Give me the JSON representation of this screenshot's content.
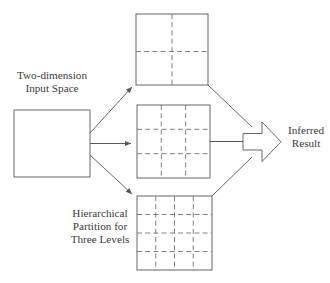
{
  "diagram": {
    "colors": {
      "solid_stroke": "#55565a",
      "dashed_stroke": "#6f7073",
      "text": "#3a3a3a",
      "background": "#ffffff"
    },
    "labels": {
      "input_space": "Two-dimension\nInput Space",
      "input_space_line1": "Two-dimension",
      "input_space_line2": "Input Space",
      "hierarchical_line1": "Hierarchical",
      "hierarchical_line2": "Partition for",
      "hierarchical_line3": "Three Levels",
      "inferred_line1": "Inferred",
      "inferred_line2": "Result"
    },
    "nodes": {
      "input_square": {
        "name": "two-dimension-input-space",
        "x": 14,
        "y": 110,
        "w": 76,
        "h": 67,
        "divisions": 1,
        "partition_label": "undivided"
      },
      "level_one_square": {
        "name": "partition-level-1",
        "x": 136,
        "y": 14,
        "w": 72,
        "h": 71,
        "divisions": 2,
        "partition_label": "2 x 2"
      },
      "level_two_square": {
        "name": "partition-level-2",
        "x": 137,
        "y": 105,
        "w": 73,
        "h": 73,
        "divisions": 3,
        "partition_label": "3 x 3"
      },
      "level_three_square": {
        "name": "partition-level-3",
        "x": 137,
        "y": 196,
        "w": 75,
        "h": 74,
        "divisions": 4,
        "partition_label": "4 x 4"
      },
      "result_arrow": {
        "name": "inferred-result-arrow",
        "x": 243,
        "y": 122,
        "w": 38,
        "h": 40
      }
    },
    "edges": [
      {
        "name": "input-to-level-1",
        "from": "input_square",
        "to": "level_one_square",
        "style": "solid-arrow"
      },
      {
        "name": "input-to-level-2",
        "from": "input_square",
        "to": "level_two_square",
        "style": "solid-arrow"
      },
      {
        "name": "input-to-level-3",
        "from": "input_square",
        "to": "level_three_square",
        "style": "solid-arrow"
      },
      {
        "name": "level-1-to-result",
        "from": "level_one_square",
        "to": "result_arrow",
        "style": "solid-line"
      },
      {
        "name": "level-2-to-result",
        "from": "level_two_square",
        "to": "result_arrow",
        "style": "solid-line"
      },
      {
        "name": "level-3-to-result",
        "from": "level_three_square",
        "to": "result_arrow",
        "style": "solid-line"
      }
    ]
  }
}
